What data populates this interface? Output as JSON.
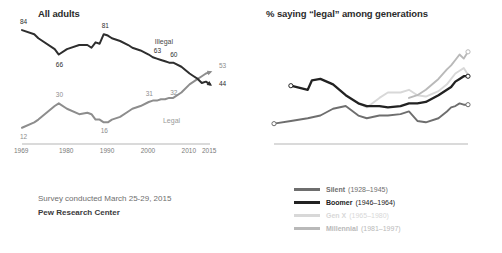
{
  "footer": {
    "survey_line": "Survey conducted March 25-29, 2015",
    "source_line": "Pew Research Center"
  },
  "colors": {
    "illegal_line": "#2e2e2e",
    "legal_line": "#8d8d8d",
    "silent": "#6e6e6e",
    "boomer": "#222222",
    "genx": "#d8d8d8",
    "millennial": "#b9b9b9",
    "axis": "#b5b5b5",
    "tick_text": "#7a7a7a"
  },
  "chart_data": [
    {
      "type": "line",
      "title": "All adults",
      "xlabel": "",
      "ylabel": "",
      "xlim": [
        1969,
        2015
      ],
      "ylim": [
        0,
        90
      ],
      "grid": false,
      "legend_position": "inline-labels",
      "ticks": [
        "1969",
        "1980",
        "1990",
        "2000",
        "2010",
        "2015"
      ],
      "tick_values": [
        1969,
        1980,
        1990,
        2000,
        2010,
        2015
      ],
      "series": [
        {
          "name": "Illegal",
          "color": "#2e2e2e",
          "inline_label": "Illegal",
          "x": [
            1969,
            1972,
            1973,
            1977,
            1978,
            1980,
            1983,
            1985,
            1986,
            1987,
            1988,
            1989,
            1990,
            1991,
            1993,
            1995,
            1996,
            1998,
            2000,
            2001,
            2002,
            2003,
            2004,
            2005,
            2006,
            2008,
            2010,
            2011,
            2012,
            2013,
            2014,
            2015
          ],
          "values": [
            84,
            81,
            78,
            70,
            66,
            70,
            73,
            73,
            71,
            75,
            74,
            81,
            80,
            78,
            76,
            73,
            71,
            69,
            66,
            64,
            63,
            62,
            61,
            60,
            60,
            57,
            52,
            50,
            48,
            45,
            46,
            44
          ],
          "point_labels": [
            {
              "x": 1969,
              "value": 84
            },
            {
              "x": 1978,
              "value": 66
            },
            {
              "x": 1989,
              "value": 81
            },
            {
              "x": 2002,
              "value": 63
            },
            {
              "x": 2006,
              "value": 60
            },
            {
              "x": 2015,
              "value": 44
            }
          ]
        },
        {
          "name": "Legal",
          "color": "#8d8d8d",
          "inline_label": "Legal",
          "x": [
            1969,
            1972,
            1973,
            1977,
            1978,
            1980,
            1983,
            1985,
            1986,
            1987,
            1988,
            1989,
            1990,
            1991,
            1993,
            1995,
            1996,
            1998,
            2000,
            2001,
            2002,
            2003,
            2004,
            2005,
            2006,
            2008,
            2010,
            2011,
            2012,
            2013,
            2014,
            2015
          ],
          "values": [
            12,
            16,
            18,
            28,
            30,
            26,
            22,
            23,
            22,
            18,
            18,
            16,
            16,
            18,
            20,
            24,
            26,
            28,
            31,
            32,
            32,
            33,
            33,
            34,
            34,
            38,
            44,
            46,
            48,
            50,
            52,
            53
          ],
          "point_labels": [
            {
              "x": 1969,
              "value": 12
            },
            {
              "x": 1978,
              "value": 30
            },
            {
              "x": 1989,
              "value": 16
            },
            {
              "x": 2000,
              "value": 31
            },
            {
              "x": 2006,
              "value": 32
            },
            {
              "x": 2015,
              "value": 53
            }
          ]
        }
      ]
    },
    {
      "type": "line",
      "title": "% saying “legal” among generations",
      "xlabel": "",
      "ylabel": "",
      "xlim": [
        1969,
        2015
      ],
      "ylim": [
        0,
        90
      ],
      "grid": false,
      "legend_position": "bottom",
      "ticks": [
        "1969",
        "1980",
        "1990",
        "2000",
        "2010",
        "2015"
      ],
      "tick_values": [
        1969,
        1980,
        1990,
        2000,
        2010,
        2015
      ],
      "series": [
        {
          "name": "Silent",
          "years": "(1928–1945)",
          "color": "#6e6e6e",
          "x": [
            1969,
            1973,
            1977,
            1980,
            1983,
            1986,
            1989,
            1991,
            1994,
            1996,
            1999,
            2001,
            2003,
            2005,
            2008,
            2010,
            2011,
            2012,
            2013,
            2014,
            2015
          ],
          "values": [
            15,
            17,
            19,
            21,
            26,
            28,
            21,
            19,
            21,
            21,
            22,
            24,
            17,
            16,
            19,
            24,
            27,
            28,
            30,
            29,
            29
          ],
          "point_labels": [
            {
              "x": 1969,
              "value": 15
            },
            {
              "x": 2015,
              "value": 29
            }
          ]
        },
        {
          "name": "Boomer",
          "years": "(1946–1964)",
          "color": "#222222",
          "x": [
            1973,
            1977,
            1978,
            1980,
            1983,
            1986,
            1989,
            1991,
            1994,
            1996,
            1999,
            2001,
            2003,
            2005,
            2008,
            2010,
            2011,
            2012,
            2013,
            2014,
            2015
          ],
          "values": [
            43,
            40,
            47,
            48,
            44,
            36,
            30,
            28,
            28,
            27,
            28,
            30,
            30,
            31,
            36,
            40,
            42,
            46,
            48,
            50,
            50
          ],
          "point_labels": [
            {
              "x": 1973,
              "value": 43
            },
            {
              "x": 2015,
              "value": 50
            }
          ]
        },
        {
          "name": "Gen X",
          "years": "(1965–1980)",
          "color": "#d8d8d8",
          "x": [
            1989,
            1991,
            1994,
            1996,
            1999,
            2001,
            2003,
            2005,
            2008,
            2010,
            2011,
            2012,
            2013,
            2014,
            2015
          ],
          "values": [
            30,
            27,
            34,
            38,
            38,
            40,
            36,
            35,
            39,
            44,
            48,
            52,
            54,
            56,
            51
          ],
          "point_labels": []
        },
        {
          "name": "Millennial",
          "years": "(1981–1997)",
          "color": "#b9b9b9",
          "x": [
            2001,
            2003,
            2005,
            2008,
            2010,
            2011,
            2012,
            2013,
            2014,
            2015
          ],
          "values": [
            34,
            36,
            40,
            48,
            55,
            58,
            62,
            66,
            63,
            68
          ],
          "point_labels": [
            {
              "x": 2015,
              "value": 68
            }
          ]
        }
      ]
    }
  ]
}
